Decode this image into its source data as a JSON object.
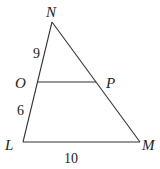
{
  "diagram": {
    "type": "geometry-triangle",
    "vertices": {
      "N": {
        "label": "N",
        "x": 52,
        "y": 22
      },
      "L": {
        "label": "L",
        "x": 23,
        "y": 142
      },
      "M": {
        "label": "M",
        "x": 140,
        "y": 142
      },
      "O": {
        "label": "O",
        "x": 38,
        "y": 82
      },
      "P": {
        "label": "P",
        "x": 96,
        "y": 82
      }
    },
    "segments": [
      {
        "from": "N",
        "to": "L"
      },
      {
        "from": "N",
        "to": "M"
      },
      {
        "from": "L",
        "to": "M"
      },
      {
        "from": "O",
        "to": "P"
      }
    ],
    "measures": {
      "NO": "9",
      "OL": "6",
      "LM": "10"
    }
  }
}
